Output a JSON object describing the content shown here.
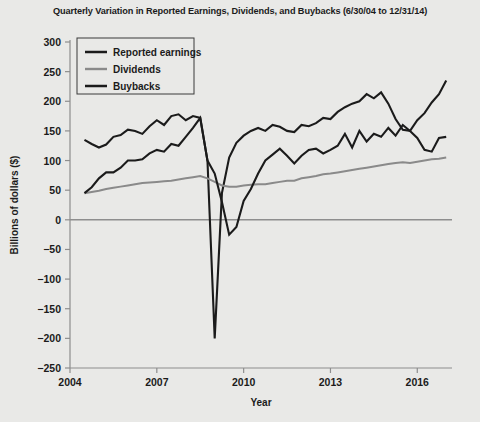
{
  "chart_data": {
    "type": "line",
    "title": "Quarterly Variation in Reported Earnings, Dividends, and Buybacks (6/30/04 to 12/31/14)",
    "xlabel": "Year",
    "ylabel": "Billions of dollars ($)",
    "xlim": [
      2004.0,
      2017.2
    ],
    "ylim": [
      -250,
      300
    ],
    "ytick_labels": [
      "300",
      "250",
      "200",
      "150",
      "100",
      "50",
      "0",
      "−50",
      "−100",
      "−150",
      "−200",
      "−250"
    ],
    "ytick_values": [
      300,
      250,
      200,
      150,
      100,
      50,
      0,
      -50,
      -100,
      -150,
      -200,
      -250
    ],
    "xtick_labels": [
      "2004",
      "2007",
      "2010",
      "2013",
      "2016"
    ],
    "xtick_values": [
      2004,
      2007,
      2010,
      2013,
      2016
    ],
    "grid": false,
    "zero_line": true,
    "legend_position": "upper-left",
    "x": [
      2004.5,
      2004.75,
      2005.0,
      2005.25,
      2005.5,
      2005.75,
      2006.0,
      2006.25,
      2006.5,
      2006.75,
      2007.0,
      2007.25,
      2007.5,
      2007.75,
      2008.0,
      2008.25,
      2008.5,
      2008.75,
      2009.0,
      2009.25,
      2009.5,
      2009.75,
      2010.0,
      2010.25,
      2010.5,
      2010.75,
      2011.0,
      2011.25,
      2011.5,
      2011.75,
      2012.0,
      2012.25,
      2012.5,
      2012.75,
      2013.0,
      2013.25,
      2013.5,
      2013.75,
      2014.0,
      2014.25,
      2014.5,
      2014.75,
      2015.0,
      2015.25,
      2015.5,
      2015.75,
      2016.0,
      2016.25,
      2016.5,
      2016.75,
      2017.0
    ],
    "series": [
      {
        "name": "Reported earnings",
        "color": "#1b1b1b",
        "width": 2.1,
        "values": [
          135,
          128,
          122,
          127,
          140,
          143,
          152,
          150,
          145,
          158,
          168,
          160,
          175,
          178,
          168,
          175,
          172,
          100,
          -200,
          45,
          105,
          130,
          142,
          150,
          155,
          150,
          160,
          157,
          150,
          148,
          160,
          158,
          163,
          172,
          170,
          182,
          190,
          196,
          200,
          212,
          205,
          215,
          196,
          170,
          152,
          150,
          168,
          180,
          198,
          212,
          235
        ]
      },
      {
        "name": "Dividends",
        "color": "#8a8a8a",
        "width": 2.0,
        "values": [
          45,
          47,
          49,
          52,
          54,
          56,
          58,
          60,
          62,
          63,
          64,
          65,
          66,
          68,
          70,
          72,
          74,
          70,
          64,
          58,
          56,
          56,
          58,
          59,
          60,
          60,
          62,
          64,
          66,
          66,
          70,
          72,
          74,
          77,
          78,
          80,
          82,
          84,
          86,
          88,
          90,
          92,
          94,
          96,
          97,
          96,
          98,
          100,
          102,
          103,
          105
        ]
      },
      {
        "name": "Buybacks",
        "color": "#1b1b1b",
        "width": 2.1,
        "values": [
          45,
          55,
          70,
          80,
          80,
          88,
          100,
          100,
          102,
          112,
          118,
          115,
          128,
          125,
          140,
          155,
          172,
          100,
          78,
          30,
          -25,
          -12,
          32,
          52,
          78,
          100,
          110,
          120,
          108,
          95,
          108,
          118,
          120,
          112,
          118,
          125,
          145,
          122,
          150,
          132,
          145,
          140,
          155,
          142,
          160,
          150,
          138,
          118,
          115,
          138,
          140
        ]
      }
    ]
  }
}
